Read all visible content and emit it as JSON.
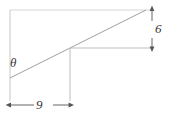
{
  "figure": {
    "type": "geometry-diagram",
    "labels": {
      "angle": "θ",
      "run": "9",
      "rise": "6"
    },
    "colors": {
      "line": "#a8a8a8",
      "dimension_line": "#555555",
      "text": "#3a3a3a",
      "background": "#ffffff"
    },
    "geometry": {
      "hypotenuse": {
        "x1": 10,
        "y1": 78,
        "x2": 145,
        "y2": 10
      },
      "mid_horizontal": {
        "x1": 70,
        "y1": 48,
        "x2": 152,
        "y2": 48
      },
      "mid_vertical": {
        "x1": 70,
        "y1": 48,
        "x2": 70,
        "y2": 100
      },
      "left_extension": {
        "x1": 10,
        "y1": 10,
        "x2": 10,
        "y2": 100
      },
      "top_extension": {
        "x1": 10,
        "y1": 10,
        "x2": 152,
        "y2": 10
      },
      "run_dimension": {
        "x1": 10,
        "y1": 105,
        "x2": 70,
        "y2": 105
      },
      "rise_dimension": {
        "x1": 152,
        "y1": 10,
        "x2": 152,
        "y2": 48
      }
    }
  }
}
